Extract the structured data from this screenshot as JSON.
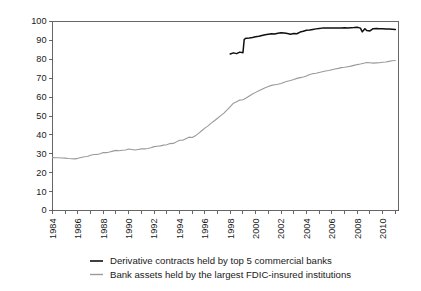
{
  "chart_data": {
    "type": "line",
    "title": "",
    "subtitle": "",
    "xlabel": "",
    "ylabel": "",
    "xlim": [
      1984,
      2011.25
    ],
    "ylim": [
      0,
      100
    ],
    "grid": false,
    "legend_position": "bottom",
    "y_ticks": [
      0,
      10,
      20,
      30,
      40,
      50,
      60,
      70,
      80,
      90,
      100
    ],
    "y_tick_labels": [
      "0",
      "10",
      "20",
      "30",
      "40",
      "50",
      "60",
      "70",
      "80",
      "90",
      "100"
    ],
    "x_ticks": [
      1984,
      1985,
      1986,
      1987,
      1988,
      1989,
      1990,
      1991,
      1992,
      1993,
      1994,
      1995,
      1996,
      1997,
      1998,
      1999,
      2000,
      2001,
      2002,
      2003,
      2004,
      2005,
      2006,
      2007,
      2008,
      2009,
      2010,
      2011
    ],
    "x_tick_labels": [
      "1984",
      "",
      "1986",
      "",
      "1988",
      "",
      "1990",
      "",
      "1992",
      "",
      "1994",
      "",
      "1996",
      "",
      "1998",
      "",
      "2000",
      "",
      "2002",
      "",
      "2004",
      "",
      "2006",
      "",
      "2008",
      "",
      "2010",
      ""
    ],
    "series": [
      {
        "name": "Derivative contracts held by top 5 commercial banks",
        "color": "#101010",
        "width": 1.5,
        "x": [
          1998.0,
          1998.25,
          1998.5,
          1998.75,
          1999.0,
          1999.1,
          1999.25,
          1999.5,
          1999.75,
          2000.0,
          2000.25,
          2000.5,
          2000.75,
          2001.0,
          2001.25,
          2001.5,
          2001.75,
          2002.0,
          2002.25,
          2002.5,
          2002.75,
          2003.0,
          2003.25,
          2003.5,
          2003.75,
          2004.0,
          2004.25,
          2004.5,
          2004.75,
          2005.0,
          2005.25,
          2005.5,
          2005.75,
          2006.0,
          2006.25,
          2006.5,
          2006.75,
          2007.0,
          2007.25,
          2007.5,
          2007.75,
          2008.0,
          2008.25,
          2008.4,
          2008.6,
          2008.75,
          2009.0,
          2009.25,
          2009.5,
          2009.75,
          2010.0,
          2010.25,
          2010.5,
          2010.75,
          2011.0
        ],
        "y": [
          82.8,
          83.4,
          83.0,
          83.8,
          83.5,
          90.6,
          91.2,
          91.3,
          91.5,
          91.9,
          92.2,
          92.6,
          93.0,
          93.3,
          93.5,
          93.4,
          93.8,
          94.0,
          93.9,
          93.6,
          93.2,
          93.6,
          93.5,
          94.4,
          94.8,
          95.4,
          95.5,
          95.8,
          96.1,
          96.3,
          96.5,
          96.6,
          96.5,
          96.6,
          96.6,
          96.5,
          96.6,
          96.7,
          96.6,
          96.7,
          96.8,
          97.0,
          96.5,
          94.5,
          96.2,
          95.2,
          95.0,
          96.2,
          96.3,
          96.2,
          96.1,
          96.0,
          96.0,
          95.9,
          95.8
        ]
      },
      {
        "name": "Bank assets held by the largest FDIC-insured institutions",
        "color": "#9a9a9a",
        "width": 1.1,
        "x": [
          1984.0,
          1984.25,
          1984.5,
          1984.75,
          1985.0,
          1985.25,
          1985.5,
          1985.75,
          1986.0,
          1986.25,
          1986.5,
          1986.75,
          1987.0,
          1987.25,
          1987.5,
          1987.75,
          1988.0,
          1988.25,
          1988.5,
          1988.75,
          1989.0,
          1989.25,
          1989.5,
          1989.75,
          1990.0,
          1990.25,
          1990.5,
          1990.75,
          1991.0,
          1991.25,
          1991.5,
          1991.75,
          1992.0,
          1992.25,
          1992.5,
          1992.75,
          1993.0,
          1993.25,
          1993.5,
          1993.75,
          1994.0,
          1994.25,
          1994.5,
          1994.75,
          1995.0,
          1995.25,
          1995.5,
          1995.75,
          1996.0,
          1996.25,
          1996.5,
          1996.75,
          1997.0,
          1997.25,
          1997.5,
          1997.75,
          1998.0,
          1998.25,
          1998.5,
          1998.75,
          1999.0,
          1999.25,
          1999.5,
          1999.75,
          2000.0,
          2000.25,
          2000.5,
          2000.75,
          2001.0,
          2001.25,
          2001.5,
          2001.75,
          2002.0,
          2002.25,
          2002.5,
          2002.75,
          2003.0,
          2003.25,
          2003.5,
          2003.75,
          2004.0,
          2004.25,
          2004.5,
          2004.75,
          2005.0,
          2005.25,
          2005.5,
          2005.75,
          2006.0,
          2006.25,
          2006.5,
          2006.75,
          2007.0,
          2007.25,
          2007.5,
          2007.75,
          2008.0,
          2008.25,
          2008.5,
          2008.75,
          2009.0,
          2009.25,
          2009.5,
          2009.75,
          2010.0,
          2010.25,
          2010.5,
          2010.75,
          2011.0
        ],
        "y": [
          28.0,
          27.9,
          27.9,
          27.8,
          27.7,
          27.5,
          27.4,
          27.3,
          27.6,
          28.0,
          28.4,
          28.6,
          29.2,
          29.6,
          29.6,
          30.0,
          30.7,
          30.6,
          31.0,
          31.4,
          31.8,
          31.6,
          31.9,
          32.0,
          32.5,
          32.3,
          32.0,
          32.3,
          32.6,
          32.6,
          32.8,
          33.2,
          33.8,
          34.0,
          34.2,
          34.6,
          34.8,
          35.4,
          35.5,
          36.3,
          37.2,
          37.2,
          38.0,
          38.8,
          38.6,
          39.5,
          40.8,
          42.2,
          43.6,
          44.8,
          46.2,
          47.5,
          48.8,
          50.2,
          51.5,
          53.2,
          55.0,
          56.8,
          57.6,
          58.4,
          58.6,
          59.5,
          60.6,
          61.6,
          62.5,
          63.4,
          64.2,
          65.0,
          65.6,
          66.2,
          66.5,
          66.8,
          67.2,
          67.9,
          68.4,
          68.8,
          69.3,
          69.9,
          70.3,
          70.6,
          71.2,
          72.0,
          72.4,
          72.6,
          73.0,
          73.4,
          73.8,
          74.1,
          74.5,
          74.9,
          75.2,
          75.6,
          75.8,
          76.1,
          76.4,
          76.8,
          77.2,
          77.5,
          77.9,
          78.3,
          78.2,
          78.0,
          78.1,
          78.2,
          78.4,
          78.6,
          78.9,
          79.2,
          79.4
        ]
      }
    ],
    "legend": [
      {
        "label": "Derivative contracts held by top 5 commercial banks",
        "color": "#101010",
        "width": 1.6
      },
      {
        "label": "Bank assets held by the largest FDIC-insured institutions",
        "color": "#9a9a9a",
        "width": 1.4
      }
    ]
  }
}
